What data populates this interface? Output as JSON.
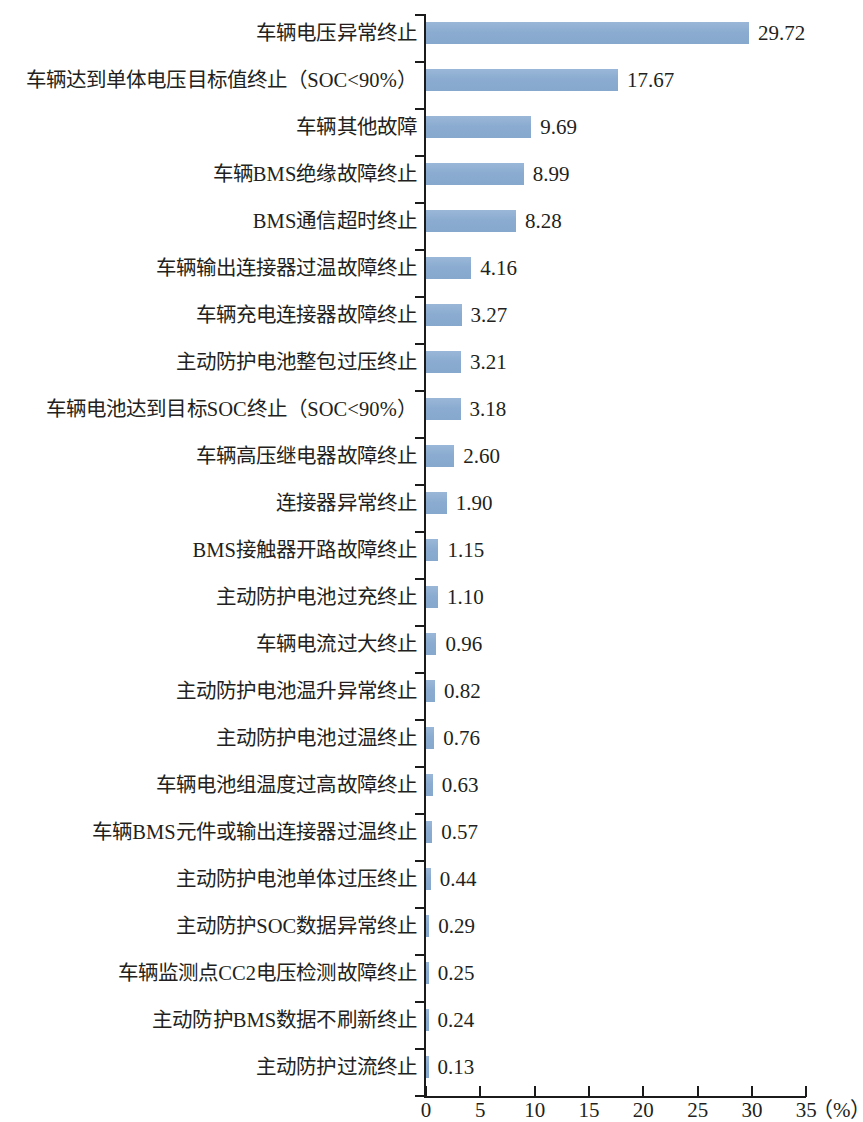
{
  "chart_data": {
    "type": "bar",
    "orientation": "horizontal",
    "title": "",
    "subtitle": "",
    "xlabel": "(%)",
    "ylabel": "",
    "xlim": [
      0,
      35
    ],
    "xticks": [
      0,
      5,
      10,
      15,
      20,
      25,
      30,
      35
    ],
    "xtick_labels": [
      "0",
      "5",
      "10",
      "15",
      "20",
      "25",
      "30",
      "35"
    ],
    "unit_label": "（%）",
    "grid": false,
    "legend": null,
    "bar_color": "#8FAED2",
    "axis_color": "#1b1b1b",
    "categories": [
      "车辆电压异常终止",
      "车辆达到单体电压目标值终止（SOC<90%）",
      "车辆其他故障",
      "车辆BMS绝缘故障终止",
      "BMS通信超时终止",
      "车辆输出连接器过温故障终止",
      "车辆充电连接器故障终止",
      "主动防护电池整包过压终止",
      "车辆电池达到目标SOC终止（SOC<90%）",
      "车辆高压继电器故障终止",
      "连接器异常终止",
      "BMS接触器开路故障终止",
      "主动防护电池过充终止",
      "车辆电流过大终止",
      "主动防护电池温升异常终止",
      "主动防护电池过温终止",
      "车辆电池组温度过高故障终止",
      "车辆BMS元件或输出连接器过温终止",
      "主动防护电池单体过压终止",
      "主动防护SOC数据异常终止",
      "车辆监测点CC2电压检测故障终止",
      "主动防护BMS数据不刷新终止",
      "主动防护过流终止"
    ],
    "values": [
      29.72,
      17.67,
      9.69,
      8.99,
      8.28,
      4.16,
      3.27,
      3.21,
      3.18,
      2.6,
      1.9,
      1.15,
      1.1,
      0.96,
      0.82,
      0.76,
      0.63,
      0.57,
      0.44,
      0.29,
      0.25,
      0.24,
      0.13
    ],
    "value_labels": [
      "29.72",
      "17.67",
      "9.69",
      "8.99",
      "8.28",
      "4.16",
      "3.27",
      "3.21",
      "3.18",
      "2.60",
      "1.90",
      "1.15",
      "1.10",
      "0.96",
      "0.82",
      "0.76",
      "0.63",
      "0.57",
      "0.44",
      "0.29",
      "0.25",
      "0.24",
      "0.13"
    ]
  }
}
